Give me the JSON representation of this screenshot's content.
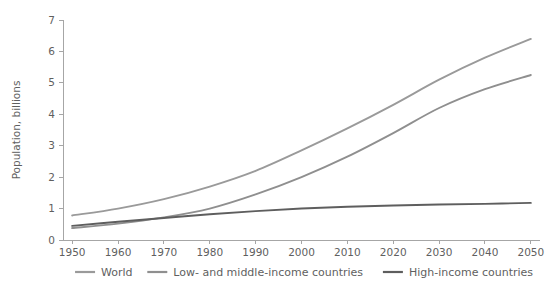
{
  "chart_data": {
    "type": "line",
    "title": "",
    "xlabel": "",
    "ylabel": "Population, billions",
    "xlim": [
      1948,
      2052
    ],
    "ylim": [
      0,
      7
    ],
    "grid": false,
    "legend_position": "bottom",
    "xticks": [
      "1950",
      "1960",
      "1970",
      "1980",
      "1990",
      "2000",
      "2010",
      "2020",
      "2030",
      "2040",
      "2050"
    ],
    "yticks": [
      "0",
      "1",
      "2",
      "3",
      "4",
      "5",
      "6",
      "7"
    ],
    "x": [
      1950,
      1960,
      1970,
      1980,
      1990,
      2000,
      2010,
      2020,
      2030,
      2040,
      2050
    ],
    "series": [
      {
        "name": "World",
        "color": "#9a9a9a",
        "values": [
          0.78,
          1.0,
          1.3,
          1.7,
          2.2,
          2.85,
          3.55,
          4.3,
          5.1,
          5.8,
          6.4
        ]
      },
      {
        "name": "Low- and middle-income countries",
        "color": "#8f8f8f",
        "values": [
          0.38,
          0.52,
          0.72,
          1.0,
          1.45,
          2.0,
          2.65,
          3.4,
          4.2,
          4.8,
          5.25
        ]
      },
      {
        "name": "High-income countries",
        "color": "#5e5e5e",
        "values": [
          0.45,
          0.58,
          0.7,
          0.82,
          0.92,
          1.0,
          1.06,
          1.1,
          1.13,
          1.15,
          1.18
        ]
      }
    ]
  },
  "legend": {
    "items": [
      {
        "label": "World",
        "color": "#9a9a9a"
      },
      {
        "label": "Low- and middle-income countries",
        "color": "#8f8f8f"
      },
      {
        "label": "High-income countries",
        "color": "#5e5e5e"
      }
    ]
  }
}
